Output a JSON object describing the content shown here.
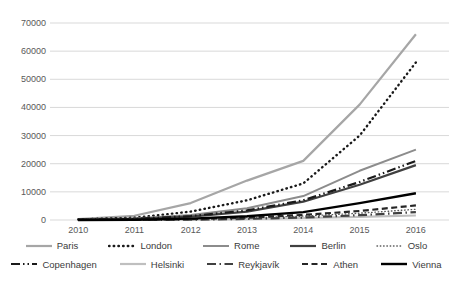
{
  "chart_data": {
    "type": "line",
    "title": "",
    "xlabel": "",
    "ylabel": "",
    "x": [
      "2010",
      "2011",
      "2012",
      "2013",
      "2014",
      "2015",
      "2016"
    ],
    "ylim": [
      0,
      70000
    ],
    "ytick_step": 10000,
    "ytick_labels": [
      "0",
      "10000",
      "20000",
      "30000",
      "40000",
      "50000",
      "60000",
      "70000"
    ],
    "grid": "horizontal",
    "legend_position": "bottom",
    "gridline_color": "#d9d9d9",
    "tick_color": "#595959",
    "background_color": "#ffffff",
    "series": [
      {
        "name": "Paris",
        "color": "#a6a6a6",
        "style": "solid",
        "width": 2.2,
        "values": [
          300,
          1500,
          6000,
          14000,
          21000,
          41000,
          66000
        ]
      },
      {
        "name": "London",
        "color": "#1a1a1a",
        "style": "dot",
        "width": 2.4,
        "values": [
          200,
          800,
          3000,
          7000,
          13000,
          30000,
          56000
        ]
      },
      {
        "name": "Rome",
        "color": "#8c8c8c",
        "style": "solid",
        "width": 2.0,
        "values": [
          100,
          500,
          1800,
          4200,
          8500,
          17500,
          25000
        ]
      },
      {
        "name": "Berlin",
        "color": "#404040",
        "style": "solid",
        "width": 2.2,
        "values": [
          100,
          400,
          1200,
          3000,
          6500,
          12500,
          19500
        ]
      },
      {
        "name": "Oslo",
        "color": "#595959",
        "style": "fine-dot",
        "width": 1.4,
        "values": [
          0,
          100,
          300,
          700,
          1400,
          2400,
          3800
        ]
      },
      {
        "name": "Copenhagen",
        "color": "#1a1a1a",
        "style": "dash-dot-dot",
        "width": 2.2,
        "values": [
          100,
          400,
          1400,
          3400,
          7000,
          13500,
          21000
        ]
      },
      {
        "name": "Helsinki",
        "color": "#bfbfbf",
        "style": "solid",
        "width": 2.2,
        "values": [
          0,
          0,
          100,
          300,
          700,
          1100,
          1600
        ]
      },
      {
        "name": "Reykjavík",
        "color": "#404040",
        "style": "dash-dot",
        "width": 2.2,
        "values": [
          0,
          0,
          100,
          400,
          900,
          1700,
          2800
        ]
      },
      {
        "name": "Athen",
        "color": "#262626",
        "style": "dash",
        "width": 2.2,
        "values": [
          0,
          100,
          300,
          800,
          1800,
          3200,
          5200
        ]
      },
      {
        "name": "Vienna",
        "color": "#000000",
        "style": "solid",
        "width": 2.4,
        "values": [
          0,
          100,
          500,
          1300,
          2800,
          6000,
          9500
        ]
      }
    ]
  }
}
